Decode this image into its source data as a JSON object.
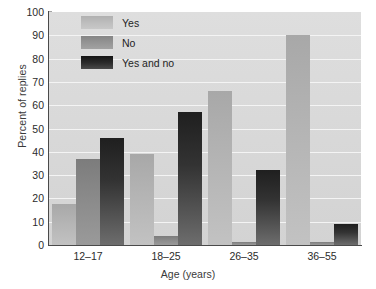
{
  "chart_data": {
    "type": "bar",
    "title": "",
    "xlabel": "Age (years)",
    "ylabel": "Percent of replies",
    "categories": [
      "12–17",
      "18–25",
      "26–35",
      "36–55"
    ],
    "series": [
      {
        "name": "Yes",
        "values": [
          17.5,
          39,
          66,
          90
        ]
      },
      {
        "name": "No",
        "values": [
          37,
          4,
          1.5,
          1.5
        ]
      },
      {
        "name": "Yes and no",
        "values": [
          46,
          57,
          32,
          9
        ]
      }
    ],
    "ylim": [
      0,
      100
    ],
    "yticks": [
      0,
      10,
      20,
      30,
      40,
      50,
      60,
      70,
      80,
      90,
      100
    ],
    "ytick_labels": [
      "0",
      "10",
      "20",
      "30",
      "40",
      "50",
      "60",
      "70",
      "80",
      "90",
      "100"
    ],
    "grid": true,
    "grid_axis": "y",
    "legend_position": "upper-left-inside",
    "colors": {
      "series_yes": "#b4b4b4",
      "series_no": "#8a8a8a",
      "series_yes_and_no": "#2b2b2b",
      "plot_background": "#d9d9d9",
      "gridline": "#f4f4f4",
      "axis": "#4a4a4a",
      "text": "#2b2b2b"
    }
  }
}
